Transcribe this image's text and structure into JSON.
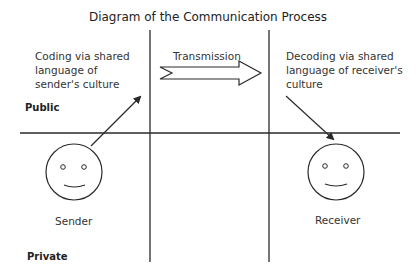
{
  "diagram": {
    "title": "Diagram of the Communication Process",
    "regions": {
      "public_label": "Public",
      "private_label": "Private"
    },
    "sender": {
      "coding_text_line1": "Coding via shared",
      "coding_text_line2": "language of",
      "coding_text_line3": "sender's culture",
      "label": "Sender"
    },
    "channel": {
      "label": "Transmission"
    },
    "receiver": {
      "decoding_text_line1": "Decoding via shared",
      "decoding_text_line2": "language of receiver's",
      "decoding_text_line3": "culture",
      "label": "Receiver"
    },
    "colors": {
      "line": "#2a2a2a",
      "text": "#333333",
      "background": "#ffffff"
    }
  }
}
